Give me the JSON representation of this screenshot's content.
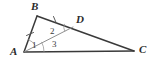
{
  "figure": {
    "type": "geometry-diagram",
    "background_color": "#ffffff",
    "stroke_color": "#3a3a3a",
    "light_stroke_color": "#8a8a8a",
    "label_color": "#2b2b2b",
    "width": 154,
    "height": 65,
    "points": [
      {
        "name": "A",
        "label": "A",
        "x": 24,
        "y": 52,
        "label_x": 10,
        "label_y": 47
      },
      {
        "name": "B",
        "label": "B",
        "x": 37,
        "y": 16,
        "label_x": 31,
        "label_y": 1
      },
      {
        "name": "C",
        "label": "C",
        "x": 134,
        "y": 51,
        "label_x": 139,
        "label_y": 44
      },
      {
        "name": "D",
        "label": "D",
        "x": 73,
        "y": 27,
        "label_x": 76,
        "label_y": 14
      }
    ],
    "segments": [
      {
        "name": "segment-AB",
        "from": "A",
        "to": "B",
        "weight": "heavy",
        "ticks": 1
      },
      {
        "name": "segment-BC",
        "from": "B",
        "to": "C",
        "weight": "heavy",
        "ticks": 0
      },
      {
        "name": "segment-AC",
        "from": "A",
        "to": "C",
        "weight": "heavy",
        "ticks": 0
      },
      {
        "name": "segment-AD",
        "from": "A",
        "to": "D",
        "weight": "light",
        "ticks": 0
      },
      {
        "name": "segment-BD",
        "from": "B",
        "to": "D",
        "weight": "heavy",
        "ticks": 1
      }
    ],
    "tick_marks": [
      {
        "name": "tick-on-AB",
        "x": 30,
        "y": 33
      },
      {
        "name": "tick-on-BD",
        "x": 55,
        "y": 20
      }
    ],
    "angle_labels": [
      {
        "name": "angle-1",
        "label": "1",
        "x": 32,
        "y": 41,
        "at_vertex": "A",
        "between": "AB and AD"
      },
      {
        "name": "angle-2",
        "label": "2",
        "x": 50,
        "y": 27,
        "at_vertex": "D",
        "between": "DB and DA"
      },
      {
        "name": "angle-3",
        "label": "3",
        "x": 52,
        "y": 40,
        "at_vertex": "A",
        "between": "AD and AC"
      }
    ],
    "angle_arcs": [
      {
        "name": "arc-angle-1",
        "vertex": "A",
        "radius": 13
      },
      {
        "name": "arc-angle-2",
        "vertex": "D",
        "radius": 9
      },
      {
        "name": "arc-angle-3",
        "vertex": "A",
        "radius": 20
      }
    ]
  }
}
